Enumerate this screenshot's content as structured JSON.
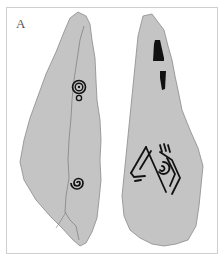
{
  "figure": {
    "panel_label": "A",
    "frame_color": "#cfcfcf",
    "stone_fill": "#c4c4c4",
    "stone_edge": "#8a8a8a",
    "motif_color": "#111111",
    "stones": [
      {
        "name": "left-stone",
        "motifs": [
          "concentric-circles-upper",
          "small-ring",
          "spiral-lower",
          "crack-line"
        ]
      },
      {
        "name": "right-stone",
        "motifs": [
          "rectangular-block-upper",
          "rectangular-block-lower",
          "anthropomorphic-arcs"
        ]
      }
    ]
  }
}
